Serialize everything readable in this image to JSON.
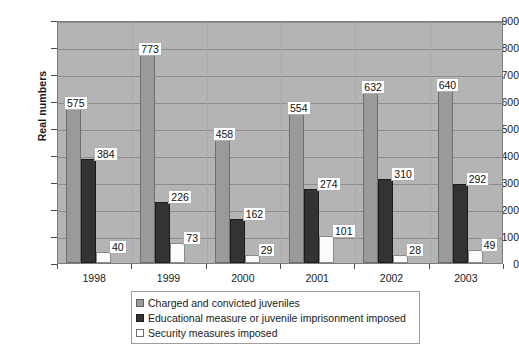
{
  "chart_data": {
    "type": "bar",
    "title": "",
    "subtitle": "",
    "xlabel": "",
    "ylabel": "Real numbers",
    "ylim": [
      0,
      900
    ],
    "ytick_step": 100,
    "yticks": [
      "900",
      "800",
      "700",
      "600",
      "500",
      "400",
      "300",
      "200",
      "100",
      "0"
    ],
    "categories": [
      "1998",
      "1999",
      "2000",
      "2001",
      "2002",
      "2003"
    ],
    "grid": true,
    "legend_position": "bottom",
    "plot_background": "#b4b4b4",
    "series": [
      {
        "name": "Charged and convicted juveniles",
        "color": "#9a9a9a",
        "values": [
          575,
          773,
          458,
          554,
          632,
          640
        ]
      },
      {
        "name": "Educational measure or juvenile imprisonment imposed",
        "color": "#333333",
        "values": [
          384,
          226,
          162,
          274,
          310,
          292
        ]
      },
      {
        "name": "Security measures imposed",
        "color": "#ffffff",
        "values": [
          40,
          73,
          29,
          101,
          28,
          49
        ]
      }
    ],
    "data_labels": [
      [
        "575",
        "773",
        "458",
        "554",
        "632",
        "640"
      ],
      [
        "384",
        "226",
        "162",
        "274",
        "310",
        "292"
      ],
      [
        "40",
        "73",
        "29",
        "101",
        "28",
        "49"
      ]
    ]
  }
}
